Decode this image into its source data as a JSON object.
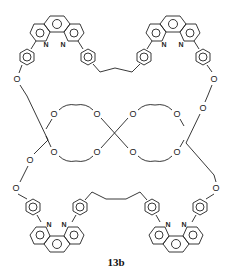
{
  "figure": {
    "compound_label": "13b",
    "atoms": {
      "oxygen": "O",
      "nitrogen": "N"
    }
  }
}
